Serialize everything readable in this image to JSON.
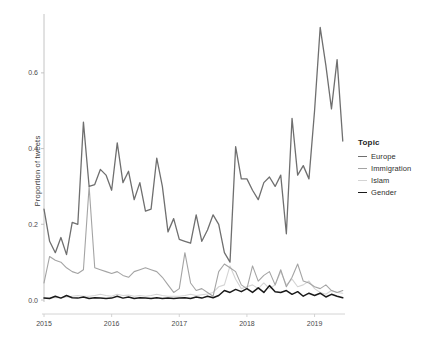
{
  "chart_data": {
    "type": "line",
    "title": "",
    "xlabel": "",
    "ylabel": "Proportion of tweets",
    "xlim": [
      2015.0,
      2019.45
    ],
    "ylim": [
      0.0,
      0.745
    ],
    "xticks": [
      "2015",
      "2016",
      "2017",
      "2018",
      "2019"
    ],
    "xtick_values": [
      2015,
      2016,
      2017,
      2018,
      2019
    ],
    "yticks": [
      "0.0",
      "0.2",
      "0.4",
      "0.6"
    ],
    "ytick_values": [
      0.0,
      0.2,
      0.4,
      0.6
    ],
    "grid": false,
    "legend_position": "right",
    "legend_title": "Topic",
    "x": [
      2015.0,
      2015.083,
      2015.167,
      2015.25,
      2015.333,
      2015.417,
      2015.5,
      2015.583,
      2015.667,
      2015.75,
      2015.833,
      2015.917,
      2016.0,
      2016.083,
      2016.167,
      2016.25,
      2016.333,
      2016.417,
      2016.5,
      2016.583,
      2016.667,
      2016.75,
      2016.833,
      2016.917,
      2017.0,
      2017.083,
      2017.167,
      2017.25,
      2017.333,
      2017.417,
      2017.5,
      2017.583,
      2017.667,
      2017.75,
      2017.833,
      2017.917,
      2018.0,
      2018.083,
      2018.167,
      2018.25,
      2018.333,
      2018.417,
      2018.5,
      2018.583,
      2018.667,
      2018.75,
      2018.833,
      2018.917,
      2019.0,
      2019.083,
      2019.167,
      2019.25,
      2019.333,
      2019.417
    ],
    "series": [
      {
        "name": "Europe",
        "color": "#6f6f6f",
        "width": 1.3,
        "values": [
          0.24,
          0.155,
          0.125,
          0.165,
          0.12,
          0.205,
          0.2,
          0.47,
          0.3,
          0.305,
          0.345,
          0.33,
          0.29,
          0.415,
          0.31,
          0.34,
          0.265,
          0.31,
          0.235,
          0.24,
          0.375,
          0.3,
          0.18,
          0.215,
          0.16,
          0.155,
          0.15,
          0.225,
          0.155,
          0.185,
          0.225,
          0.2,
          0.125,
          0.1,
          0.405,
          0.32,
          0.32,
          0.29,
          0.265,
          0.31,
          0.325,
          0.3,
          0.33,
          0.175,
          0.48,
          0.33,
          0.355,
          0.32,
          0.5,
          0.72,
          0.62,
          0.505,
          0.635,
          0.42
        ]
      },
      {
        "name": "Immigration",
        "color": "#a4a4a4",
        "width": 1.1,
        "values": [
          0.045,
          0.115,
          0.105,
          0.1,
          0.085,
          0.075,
          0.07,
          0.08,
          0.3,
          0.085,
          0.08,
          0.075,
          0.07,
          0.075,
          0.065,
          0.06,
          0.075,
          0.08,
          0.085,
          0.08,
          0.075,
          0.06,
          0.04,
          0.02,
          0.03,
          0.125,
          0.045,
          0.025,
          0.03,
          0.02,
          0.01,
          0.075,
          0.095,
          0.085,
          0.075,
          0.04,
          0.03,
          0.09,
          0.05,
          0.065,
          0.075,
          0.04,
          0.08,
          0.035,
          0.06,
          0.095,
          0.05,
          0.045,
          0.035,
          0.03,
          0.04,
          0.025,
          0.02,
          0.025
        ]
      },
      {
        "name": "Islam",
        "color": "#d4d4d4",
        "width": 1.1,
        "values": [
          0.005,
          0.006,
          0.007,
          0.006,
          0.008,
          0.01,
          0.012,
          0.01,
          0.01,
          0.012,
          0.015,
          0.012,
          0.01,
          0.015,
          0.012,
          0.013,
          0.01,
          0.012,
          0.01,
          0.012,
          0.015,
          0.012,
          0.01,
          0.01,
          0.01,
          0.012,
          0.015,
          0.012,
          0.014,
          0.016,
          0.02,
          0.035,
          0.04,
          0.09,
          0.055,
          0.03,
          0.035,
          0.04,
          0.03,
          0.045,
          0.03,
          0.04,
          0.075,
          0.04,
          0.055,
          0.035,
          0.04,
          0.05,
          0.03,
          0.02,
          0.015,
          0.025,
          0.02,
          0.018
        ]
      },
      {
        "name": "Gender",
        "color": "#1a1a1a",
        "width": 1.5,
        "values": [
          0.005,
          0.004,
          0.01,
          0.005,
          0.012,
          0.006,
          0.005,
          0.008,
          0.004,
          0.006,
          0.005,
          0.004,
          0.005,
          0.01,
          0.005,
          0.008,
          0.004,
          0.006,
          0.005,
          0.004,
          0.006,
          0.004,
          0.005,
          0.004,
          0.005,
          0.006,
          0.004,
          0.008,
          0.005,
          0.01,
          0.006,
          0.012,
          0.025,
          0.02,
          0.028,
          0.022,
          0.03,
          0.02,
          0.032,
          0.02,
          0.038,
          0.022,
          0.02,
          0.025,
          0.015,
          0.022,
          0.01,
          0.018,
          0.012,
          0.018,
          0.008,
          0.015,
          0.01,
          0.006
        ]
      }
    ]
  },
  "legend": {
    "title": "Topic",
    "items": [
      {
        "label": "Europe"
      },
      {
        "label": "Immigration"
      },
      {
        "label": "Islam"
      },
      {
        "label": "Gender"
      }
    ]
  },
  "axes": {
    "y_axis_label": "Proportion of tweets"
  }
}
